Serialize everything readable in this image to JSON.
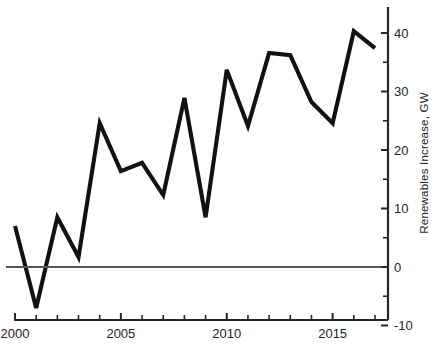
{
  "chart_data": {
    "type": "line",
    "title": "",
    "xlabel": "",
    "ylabel": "Renewables Increase, GW",
    "x": [
      2000,
      2001,
      2002,
      2003,
      2004,
      2005,
      2006,
      2007,
      2008,
      2009,
      2010,
      2011,
      2012,
      2013,
      2014,
      2015,
      2016,
      2017
    ],
    "values": [
      7,
      -7,
      8.5,
      1.7,
      24.6,
      16.4,
      17.8,
      12.3,
      28.9,
      8.5,
      33.7,
      24.1,
      36.6,
      36.2,
      28.2,
      24.6,
      40.3,
      37.4
    ],
    "series": [
      {
        "name": "Renewables Increase",
        "values": [
          7,
          -7,
          8.5,
          1.7,
          24.6,
          16.4,
          17.8,
          12.3,
          28.9,
          8.5,
          33.7,
          24.1,
          36.6,
          36.2,
          28.2,
          24.6,
          40.3,
          37.4
        ]
      }
    ],
    "xlim": [
      2000,
      2017
    ],
    "ylim": [
      -10,
      43
    ],
    "xticks": [
      2000,
      2001,
      2002,
      2003,
      2004,
      2005,
      2006,
      2007,
      2008,
      2009,
      2010,
      2011,
      2012,
      2013,
      2014,
      2015,
      2016,
      2017
    ],
    "xtick_labels_shown": [
      "2000",
      "2005",
      "2010",
      "2015"
    ],
    "yticks": [
      -10,
      -5,
      0,
      5,
      10,
      15,
      20,
      25,
      30,
      35,
      40
    ],
    "ytick_labels_shown": [
      "-10",
      "0",
      "10",
      "20",
      "30",
      "40"
    ],
    "grid": false,
    "legend": "none",
    "y_axis_position": "right",
    "zero_reference_line": true,
    "line_color": "#111111",
    "zero_line_color": "#555555",
    "axis_color": "#262626"
  },
  "axis": {
    "x_labels": [
      {
        "text": "2000",
        "value": 2000
      },
      {
        "text": "2005",
        "value": 2005
      },
      {
        "text": "2010",
        "value": 2010
      },
      {
        "text": "2015",
        "value": 2015
      }
    ],
    "y_labels": [
      {
        "text": "40",
        "value": 40
      },
      {
        "text": "30",
        "value": 30
      },
      {
        "text": "20",
        "value": 20
      },
      {
        "text": "10",
        "value": 10
      },
      {
        "text": "0",
        "value": 0
      },
      {
        "text": "-10",
        "value": -10
      }
    ],
    "y_title": "Renewables Increase, GW"
  }
}
